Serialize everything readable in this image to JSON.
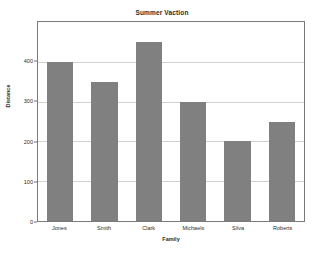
{
  "chart_data": {
    "type": "bar",
    "title": "Summer Vaction",
    "xlabel": "Family",
    "ylabel": "Distance",
    "categories": [
      "Jones",
      "Smith",
      "Clark",
      "Michaels",
      "Silva",
      "Roberts"
    ],
    "values": [
      400,
      350,
      450,
      300,
      200,
      250
    ],
    "ylim": [
      0,
      500
    ],
    "yticks": [
      0,
      100,
      200,
      300,
      400
    ],
    "ytick_labels": [
      "0",
      "100",
      "200",
      "300",
      "400"
    ],
    "grid": true,
    "grid_axis": "y",
    "legend": false,
    "bar_color": "#808080",
    "plot_border_color": "#7a7a7a",
    "gridline_color": "#d2d2d2",
    "background_color": "#ffffff",
    "text_color": "#2b2b2b"
  }
}
